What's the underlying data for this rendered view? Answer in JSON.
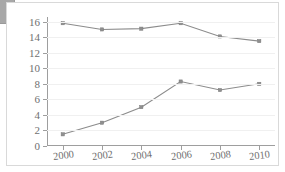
{
  "chart_data": {
    "type": "line",
    "title": "",
    "subtitle": "",
    "xlabel": "",
    "ylabel": "",
    "x": [
      2000,
      2002,
      2004,
      2006,
      2008,
      2010
    ],
    "categories": [
      "2000",
      "2002",
      "2004",
      "2006",
      "2008",
      "2010"
    ],
    "xtick_labels": [
      "2000",
      "2002",
      "2004",
      "2006",
      "2008",
      "2010"
    ],
    "ytick_labels": [
      "0",
      "2",
      "4",
      "6",
      "8",
      "10",
      "12",
      "14",
      "16"
    ],
    "yticks": [
      0,
      2,
      4,
      6,
      8,
      10,
      12,
      14,
      16
    ],
    "ylim": [
      0,
      16.6
    ],
    "xlim": [
      1999.2,
      2010.8
    ],
    "grid": "horizontal",
    "legend": "none",
    "series": [
      {
        "name": "Upper series",
        "color": "#8c8c8c",
        "marker": "square",
        "values": [
          15.8,
          15.0,
          15.1,
          15.8,
          14.1,
          13.5
        ]
      },
      {
        "name": "Lower series",
        "color": "#8c8c8c",
        "marker": "square",
        "values": [
          1.5,
          3.0,
          5.0,
          8.3,
          7.2,
          8.0
        ]
      }
    ]
  },
  "colors": {
    "line": "#8c8c8c",
    "marker": "#8f8f8f",
    "axis": "#9e9e9e",
    "grid": "#f0f0f0",
    "tick_text": "#6f6f6f",
    "panel_border": "#d9d9d9",
    "corner_block": "#a8a8a8",
    "background": "#ffffff"
  }
}
